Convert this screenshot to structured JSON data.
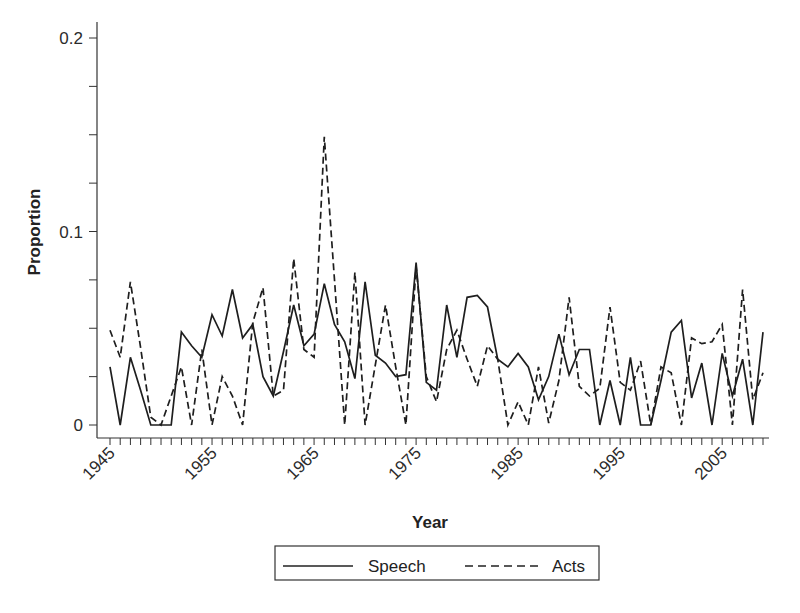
{
  "chart_data": {
    "type": "line",
    "title": "",
    "xlabel": "Year",
    "ylabel": "Proportion",
    "ylim": [
      0,
      0.2
    ],
    "xlim": [
      1945,
      2009
    ],
    "grid": false,
    "legend_position": "bottom",
    "y_ticks": [
      {
        "value": 0,
        "label": "0"
      },
      {
        "value": 0.1,
        "label": "0.1"
      },
      {
        "value": 0.2,
        "label": "0.2"
      }
    ],
    "y_minor_step": 0.025,
    "x_tick_labels": [
      "1945",
      "1955",
      "1965",
      "1975",
      "1985",
      "1995",
      "2005"
    ],
    "x": [
      1945,
      1946,
      1947,
      1948,
      1949,
      1950,
      1951,
      1952,
      1953,
      1954,
      1955,
      1956,
      1957,
      1958,
      1959,
      1960,
      1961,
      1962,
      1963,
      1964,
      1965,
      1966,
      1967,
      1968,
      1969,
      1970,
      1971,
      1972,
      1973,
      1974,
      1975,
      1976,
      1977,
      1978,
      1979,
      1980,
      1981,
      1982,
      1983,
      1984,
      1985,
      1986,
      1987,
      1988,
      1989,
      1990,
      1991,
      1992,
      1993,
      1994,
      1995,
      1996,
      1997,
      1998,
      1999,
      2000,
      2001,
      2002,
      2003,
      2004,
      2005,
      2006,
      2007,
      2008,
      2009
    ],
    "series": [
      {
        "name": "Speech",
        "style": "solid",
        "values": [
          0.03,
          0.0,
          0.035,
          0.018,
          0.0,
          0.0,
          0.0,
          0.048,
          0.041,
          0.035,
          0.057,
          0.046,
          0.07,
          0.045,
          0.052,
          0.025,
          0.015,
          0.038,
          0.062,
          0.041,
          0.047,
          0.073,
          0.052,
          0.043,
          0.024,
          0.074,
          0.036,
          0.032,
          0.025,
          0.026,
          0.084,
          0.022,
          0.018,
          0.062,
          0.035,
          0.066,
          0.067,
          0.061,
          0.034,
          0.03,
          0.037,
          0.03,
          0.013,
          0.025,
          0.047,
          0.026,
          0.039,
          0.039,
          0.0,
          0.023,
          0.0,
          0.035,
          0.0,
          0.0,
          0.023,
          0.048,
          0.054,
          0.014,
          0.032,
          0.0,
          0.037,
          0.015,
          0.034,
          0.0,
          0.048
        ]
      },
      {
        "name": "Acts",
        "style": "dashed",
        "values": [
          0.049,
          0.035,
          0.074,
          0.04,
          0.004,
          0.0,
          0.015,
          0.03,
          0.0,
          0.039,
          0.0,
          0.025,
          0.015,
          0.0,
          0.053,
          0.071,
          0.015,
          0.018,
          0.086,
          0.039,
          0.035,
          0.149,
          0.075,
          0.0,
          0.079,
          0.0,
          0.031,
          0.062,
          0.03,
          0.0,
          0.082,
          0.025,
          0.012,
          0.039,
          0.049,
          0.034,
          0.02,
          0.041,
          0.034,
          0.0,
          0.012,
          0.0,
          0.03,
          0.001,
          0.023,
          0.066,
          0.02,
          0.015,
          0.019,
          0.061,
          0.022,
          0.018,
          0.033,
          0.0,
          0.03,
          0.027,
          0.0,
          0.045,
          0.042,
          0.043,
          0.052,
          0.0,
          0.07,
          0.013,
          0.027
        ]
      }
    ]
  },
  "legend": {
    "items": [
      {
        "label": "Speech",
        "style": "solid"
      },
      {
        "label": "Acts",
        "style": "dashed"
      }
    ]
  },
  "axes": {
    "x_title": "Year",
    "y_title": "Proportion"
  }
}
